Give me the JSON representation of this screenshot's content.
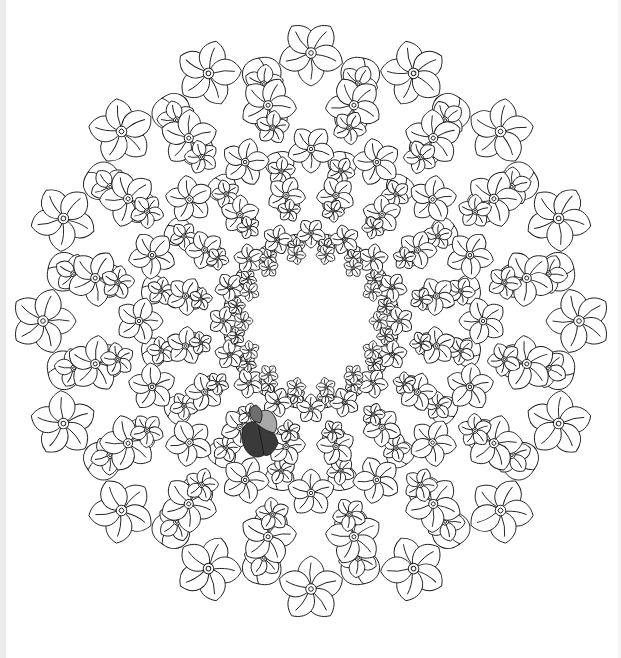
{
  "image": {
    "type": "coloring-page",
    "subject": "floral mandala",
    "description": "Black line-art circular mandala of overlapping flowers with a white empty center; one small petal cluster at lower-left is shaded in grays."
  },
  "mandala": {
    "center": [
      311,
      321
    ],
    "outer_radius": 300,
    "inner_hole_radius": 62,
    "rings": [
      {
        "radius": 268,
        "petal_count": 16,
        "petal_length": 44,
        "petal_width": 26
      },
      {
        "radius": 220,
        "petal_count": 16,
        "petal_length": 38,
        "petal_width": 22
      },
      {
        "radius": 172,
        "petal_count": 16,
        "petal_length": 32,
        "petal_width": 20
      },
      {
        "radius": 128,
        "petal_count": 16,
        "petal_length": 26,
        "petal_width": 16
      },
      {
        "radius": 88,
        "petal_count": 16,
        "petal_length": 20,
        "petal_width": 12
      }
    ]
  },
  "colors": {
    "line": "#1a1a1a",
    "background": "#ffffff",
    "shade_dark": "#3a3a3a",
    "shade_mid": "#6e6e6e",
    "shade_light": "#a8a8a8",
    "edge_strip": "#ececec"
  },
  "shaded_region": {
    "center": [
      262,
      437
    ],
    "label": "colored petal cluster"
  }
}
